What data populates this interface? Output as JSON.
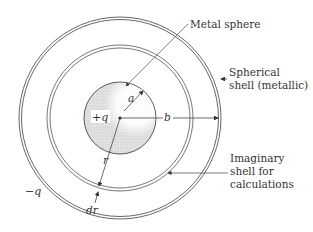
{
  "diagram": {
    "labels": {
      "metal_sphere": "Metal sphere",
      "spherical_shell_line1": "Spherical",
      "spherical_shell_line2": "shell (metallic)",
      "imaginary_line1": "Imaginary",
      "imaginary_line2": "shell for",
      "imaginary_line3": "calculations",
      "plus_q": "+q",
      "minus_q": "−q",
      "a": "a",
      "b": "b",
      "r": "r",
      "dr": "dr"
    },
    "colors": {
      "stroke": "#444444",
      "sphere_fill": "#d9d9d9",
      "highlight": "#ffffff"
    }
  }
}
